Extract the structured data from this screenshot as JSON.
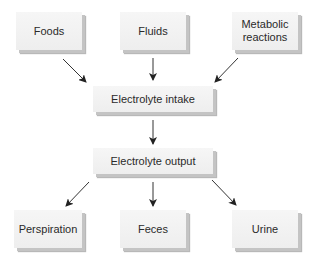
{
  "diagram": {
    "sources": [
      {
        "id": "foods",
        "label": "Foods"
      },
      {
        "id": "fluids",
        "label": "Fluids"
      },
      {
        "id": "metabolic",
        "label": "Metabolic reactions"
      }
    ],
    "intake": {
      "label": "Electrolyte intake"
    },
    "output": {
      "label": "Electrolyte output"
    },
    "sinks": [
      {
        "id": "perspiration",
        "label": "Perspiration"
      },
      {
        "id": "feces",
        "label": "Feces"
      },
      {
        "id": "urine",
        "label": "Urine"
      }
    ],
    "edges": [
      {
        "from": "Foods",
        "to": "Electrolyte intake"
      },
      {
        "from": "Fluids",
        "to": "Electrolyte intake"
      },
      {
        "from": "Metabolic reactions",
        "to": "Electrolyte intake"
      },
      {
        "from": "Electrolyte intake",
        "to": "Electrolyte output"
      },
      {
        "from": "Electrolyte output",
        "to": "Perspiration"
      },
      {
        "from": "Electrolyte output",
        "to": "Feces"
      },
      {
        "from": "Electrolyte output",
        "to": "Urine"
      }
    ]
  }
}
